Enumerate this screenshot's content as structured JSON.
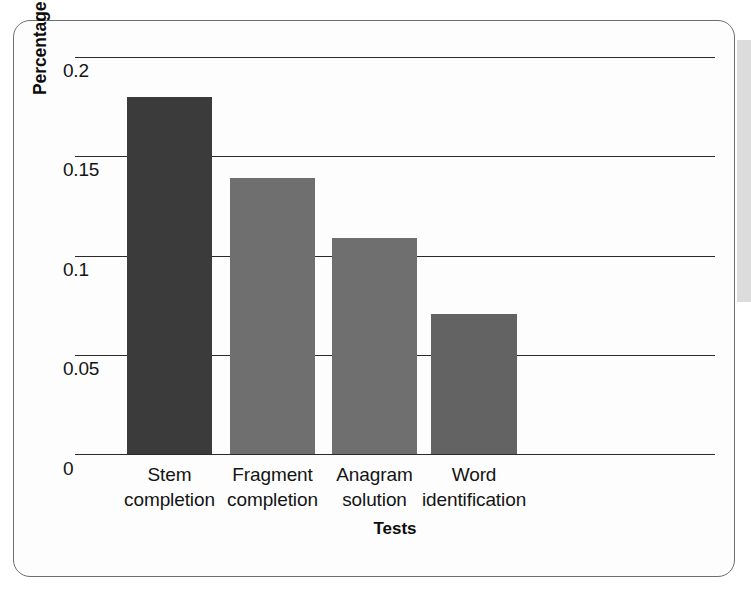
{
  "figure": {
    "frame_border_color": "#6e6e6e",
    "background_color": "#fdfdfd"
  },
  "chart_data": {
    "type": "bar",
    "title": "",
    "xlabel": "Tests",
    "ylabel": "Percentage improvement over control",
    "categories": [
      "Stem completion",
      "Fragment completion",
      "Anagram solution",
      "Word identification"
    ],
    "category_lines": [
      [
        "Stem",
        "completion"
      ],
      [
        "Fragment",
        "completion"
      ],
      [
        "Anagram",
        "solution"
      ],
      [
        "Word",
        "identification"
      ]
    ],
    "values": [
      0.18,
      0.139,
      0.109,
      0.071
    ],
    "bar_colors": [
      "#3b3b3b",
      "#6f6f6f",
      "#6f6f6f",
      "#636363"
    ],
    "ylim": [
      0,
      0.205
    ],
    "yticks": [
      0,
      0.05,
      0.1,
      0.15,
      0.2
    ],
    "ytick_labels": [
      "0",
      "0.05",
      "0.1",
      "0.15",
      "0.2"
    ],
    "grid": true,
    "grid_color": "#2a2a2a",
    "legend": null,
    "legend_position": "none"
  }
}
